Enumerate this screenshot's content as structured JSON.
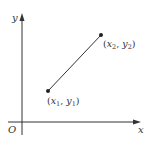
{
  "diagram": {
    "type": "coordinate-plane-line-segment",
    "axes": {
      "x_label": "x",
      "y_label": "y",
      "origin_label": "O"
    },
    "points": [
      {
        "name": "point-1",
        "label_var_x": "x",
        "label_sub_x": "1",
        "label_var_y": "y",
        "label_sub_y": "1",
        "label": "(x1, y1)",
        "px": [
          48,
          91
        ]
      },
      {
        "name": "point-2",
        "label_var_x": "x",
        "label_sub_x": "2",
        "label_var_y": "y",
        "label_sub_y": "2",
        "label": "(x2, y2)",
        "px": [
          101,
          35
        ]
      }
    ],
    "segment": {
      "from": "point-1",
      "to": "point-2"
    },
    "colors": {
      "ink": "#333333",
      "background": "#ffffff"
    },
    "punct": {
      "open": "(",
      "comma": ", ",
      "close": ")"
    }
  }
}
